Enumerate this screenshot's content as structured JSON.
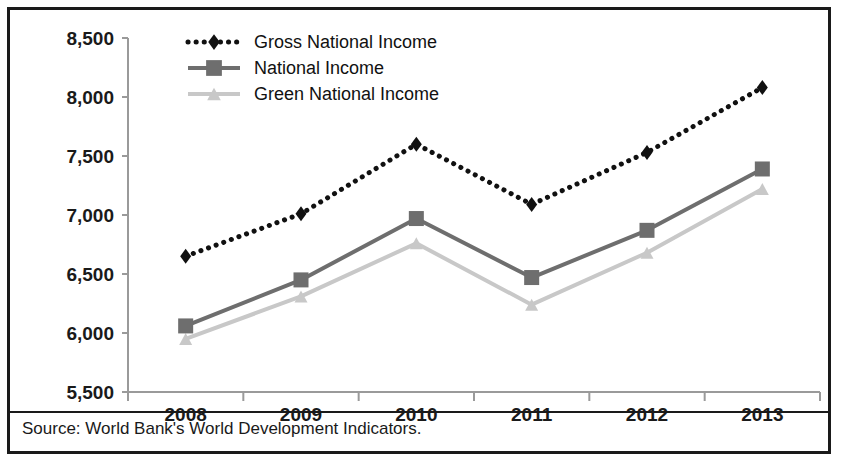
{
  "figure": {
    "source_note": "Source: World Bank's World Development Indicators.",
    "border_color": "#1a1a1a",
    "background": "#ffffff"
  },
  "chart_data": {
    "type": "line",
    "title": "",
    "subtitle": "",
    "xlabel": "",
    "ylabel": "",
    "categories": [
      "2008",
      "2009",
      "2010",
      "2011",
      "2012",
      "2013"
    ],
    "x_tick_labels": [
      "2008",
      "2009",
      "2010",
      "2011",
      "2012",
      "2013"
    ],
    "y_tick_labels": [
      "5,500",
      "6,000",
      "6,500",
      "7,000",
      "7,500",
      "8,000",
      "8,500"
    ],
    "y_ticks": [
      5500,
      6000,
      6500,
      7000,
      7500,
      8000,
      8500
    ],
    "ylim": [
      5500,
      8500
    ],
    "grid": false,
    "legend_position": "top-center",
    "series": [
      {
        "name": "Gross National Income",
        "values": [
          6650,
          7010,
          7600,
          7090,
          7530,
          8080
        ],
        "color": "#111111",
        "line_style": "dotted",
        "marker": "diamond"
      },
      {
        "name": "National Income",
        "values": [
          6060,
          6450,
          6970,
          6470,
          6870,
          7390
        ],
        "color": "#6e6e6e",
        "line_style": "solid",
        "marker": "square"
      },
      {
        "name": "Green National Income",
        "values": [
          5950,
          6310,
          6760,
          6240,
          6680,
          7220
        ],
        "color": "#c8c8c8",
        "line_style": "solid",
        "marker": "triangle"
      }
    ]
  }
}
